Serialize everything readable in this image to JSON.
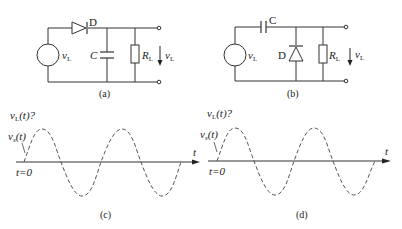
{
  "circuit_a": {
    "caption": "(a)",
    "diode_label": "D",
    "capacitor_label": "C",
    "resistor_label": "R",
    "resistor_sub": "L",
    "source_label": "v",
    "source_sub": "L",
    "output_label": "v",
    "output_sub": "L"
  },
  "circuit_b": {
    "caption": "(b)",
    "diode_label": "D",
    "capacitor_label": "C",
    "resistor_label": "R",
    "resistor_sub": "L",
    "source_label": "v",
    "source_sub": "L",
    "output_label": "v",
    "output_sub": "L"
  },
  "plot_c": {
    "caption": "(c)",
    "output_label": "v",
    "output_sub": "L",
    "output_suffix": "(t)?",
    "input_label": "v",
    "input_sub": "s",
    "input_suffix": "(t)",
    "t0_label": "t=0",
    "axis_label": "t"
  },
  "plot_d": {
    "caption": "(d)",
    "output_label": "v",
    "output_sub": "L",
    "output_suffix": "(t)?",
    "input_label": "v",
    "input_sub": "s",
    "input_suffix": "(t)",
    "t0_label": "t=0",
    "axis_label": "t"
  }
}
